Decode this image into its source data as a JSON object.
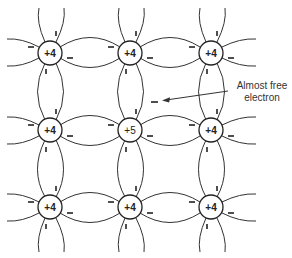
{
  "diagram": {
    "title": "",
    "lattice": {
      "rows": 3,
      "cols": 3,
      "atoms": [
        {
          "row": 0,
          "col": 0,
          "label": "+4"
        },
        {
          "row": 0,
          "col": 1,
          "label": "+4"
        },
        {
          "row": 0,
          "col": 2,
          "label": "+4"
        },
        {
          "row": 1,
          "col": 0,
          "label": "+4"
        },
        {
          "row": 1,
          "col": 1,
          "label": "+5"
        },
        {
          "row": 1,
          "col": 2,
          "label": "+4"
        },
        {
          "row": 2,
          "col": 0,
          "label": "+4"
        },
        {
          "row": 2,
          "col": 1,
          "label": "+4"
        },
        {
          "row": 2,
          "col": 2,
          "label": "+4"
        }
      ]
    },
    "annotation": {
      "line1": "Almost free",
      "line2": "electron",
      "points_to": "free-electron"
    },
    "free_electron_symbol": "−",
    "colors": {
      "stroke": "#222222",
      "background": "#ffffff"
    }
  }
}
